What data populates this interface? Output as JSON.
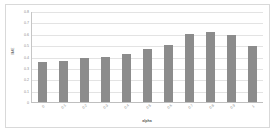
{
  "chart_data": {
    "type": "bar",
    "title": "",
    "xlabel": "alpha",
    "ylabel": "MAE",
    "categories": [
      "0",
      "0.1",
      "0.2",
      "0.3",
      "0.4",
      "0.5",
      "0.6",
      "0.7",
      "0.8",
      "0.9",
      "1"
    ],
    "values": [
      0.35,
      0.36,
      0.385,
      0.4,
      0.425,
      0.465,
      0.5,
      0.595,
      0.615,
      0.585,
      0.49
    ],
    "ylim": [
      0,
      0.8
    ],
    "ytick_labels": [
      "0",
      "0.1",
      "0.2",
      "0.3",
      "0.4",
      "0.5",
      "0.6",
      "0.7",
      "0.8"
    ],
    "ytick_values": [
      0,
      0.1,
      0.2,
      0.3,
      0.4,
      0.5,
      0.6,
      0.7,
      0.8
    ],
    "grid": true,
    "legend": false,
    "bar_color": "#8c8c8c",
    "gridline_color": "#e3e3e3",
    "axis_color": "#bfbfbf",
    "background": "#ffffff",
    "border_color": "#d9d9d9"
  }
}
